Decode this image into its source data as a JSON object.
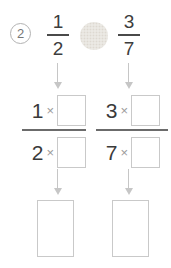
{
  "problem": {
    "number": "2",
    "left_fraction": {
      "numerator": "1",
      "denominator": "2"
    },
    "right_fraction": {
      "numerator": "3",
      "denominator": "7"
    }
  },
  "work": {
    "multiply_sign": "×",
    "left": {
      "numerator_factor": "1",
      "denominator_factor": "2"
    },
    "right": {
      "numerator_factor": "3",
      "denominator_factor": "7"
    }
  },
  "inputs": {
    "comparison_value": "",
    "left_numerator_box": "",
    "left_denominator_box": "",
    "right_numerator_box": "",
    "right_denominator_box": "",
    "left_answer_box": "",
    "right_answer_box": ""
  },
  "colors": {
    "digit": "#3d3d3d",
    "times_sign": "#9b9b9b",
    "box_border": "#c9c9c9",
    "arrow": "#c6c6c6",
    "fraction_bar": "#4a4a4a",
    "work_bar": "#6b6b6b",
    "comparison_fill": "#ebe9e4",
    "badge_border": "#b2b2b2",
    "badge_text": "#777777"
  }
}
